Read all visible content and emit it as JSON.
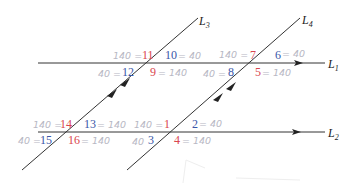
{
  "diagram": {
    "type": "parallel lines cut by parallel transversals",
    "colors": {
      "line": "#333333",
      "red": "#d9464e",
      "blue": "#3a56a8",
      "handwriting": "#b8b8c4"
    },
    "lines": {
      "L1": {
        "label": "L",
        "sub": "1"
      },
      "L2": {
        "label": "L",
        "sub": "2"
      },
      "L3": {
        "label": "L",
        "sub": "3"
      },
      "L4": {
        "label": "L",
        "sub": "4"
      }
    },
    "angles": [
      {
        "n": "1",
        "color": "red",
        "note": "140 ="
      },
      {
        "n": "2",
        "color": "blue",
        "note": "= 40"
      },
      {
        "n": "3",
        "color": "blue",
        "note": "40"
      },
      {
        "n": "4",
        "color": "red",
        "note": "= 140"
      },
      {
        "n": "5",
        "color": "red",
        "note": "= 140"
      },
      {
        "n": "6",
        "color": "blue",
        "note": "= 40"
      },
      {
        "n": "7",
        "color": "red",
        "note": "140 ="
      },
      {
        "n": "8",
        "color": "blue",
        "note": "40 ="
      },
      {
        "n": "9",
        "color": "red",
        "note": "= 140"
      },
      {
        "n": "10",
        "color": "blue",
        "note": "= 40"
      },
      {
        "n": "11",
        "color": "red",
        "note": "140 ="
      },
      {
        "n": "12",
        "color": "blue",
        "note": "40 ="
      },
      {
        "n": "13",
        "color": "blue",
        "note": "= 140"
      },
      {
        "n": "14",
        "color": "red",
        "note": "140 ="
      },
      {
        "n": "15",
        "color": "blue",
        "note": "40 ="
      },
      {
        "n": "16",
        "color": "red",
        "note": "= 140"
      }
    ]
  }
}
